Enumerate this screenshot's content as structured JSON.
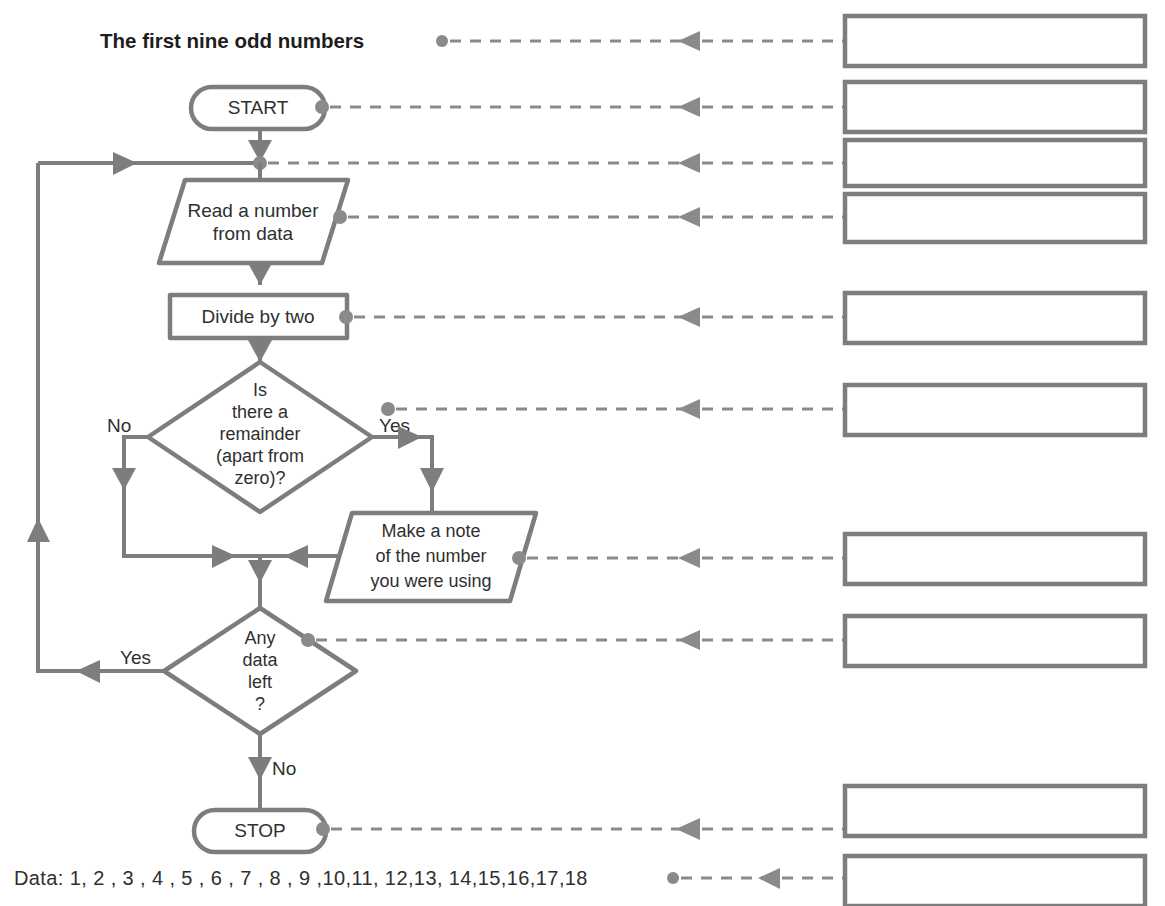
{
  "page": {
    "title_label": "The first nine odd numbers",
    "data_label": "Data:  1, 2 , 3 , 4 , 5 , 6 , 7 , 8 , 9 ,10,11, 12,13, 14,15,16,17,18"
  },
  "flowchart": {
    "nodes": {
      "start": {
        "label": "START",
        "shape": "terminator"
      },
      "read": {
        "line1": "Read a number",
        "line2": "from data",
        "shape": "input-parallelogram"
      },
      "divide": {
        "label": "Divide by two",
        "shape": "process"
      },
      "remainder": {
        "line1": "Is",
        "line2": "there a",
        "line3": "remainder",
        "line4": "(apart from",
        "line5": "zero)?",
        "shape": "decision"
      },
      "note": {
        "line1": "Make a note",
        "line2": "of the number",
        "line3": "you were using",
        "shape": "output-parallelogram"
      },
      "anydata": {
        "line1": "Any",
        "line2": "data",
        "line3": "left",
        "line4": "?",
        "shape": "decision"
      },
      "stop": {
        "label": "STOP",
        "shape": "terminator"
      }
    },
    "branch_labels": {
      "remainder_no": "No",
      "remainder_yes": "Yes",
      "anydata_yes": "Yes",
      "anydata_no": "No"
    }
  },
  "answer_boxes": [
    {
      "id": "box-1",
      "value": "",
      "source": "title"
    },
    {
      "id": "box-2",
      "value": "",
      "source": "start"
    },
    {
      "id": "box-3",
      "value": "",
      "source": "loop-junction"
    },
    {
      "id": "box-4",
      "value": "",
      "source": "read"
    },
    {
      "id": "box-5",
      "value": "",
      "source": "divide"
    },
    {
      "id": "box-6",
      "value": "",
      "source": "remainder"
    },
    {
      "id": "box-7",
      "value": "",
      "source": "note"
    },
    {
      "id": "box-8",
      "value": "",
      "source": "anydata"
    },
    {
      "id": "box-9",
      "value": "",
      "source": "stop"
    },
    {
      "id": "box-10",
      "value": "",
      "source": "data"
    }
  ],
  "colors": {
    "stroke": "#7d7d7d",
    "leader": "#8a8a8a",
    "text": "#2f2f2f",
    "background": "#ffffff"
  }
}
